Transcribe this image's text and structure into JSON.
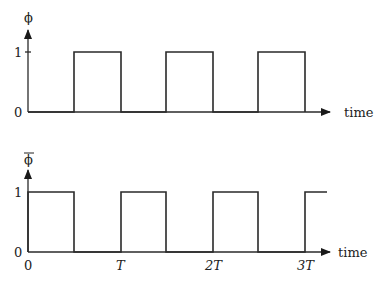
{
  "top_plot": {
    "y_label": "ϕ",
    "y_tick_high": "1",
    "y_tick_low": "0",
    "x_axis_label": "time",
    "levels": [
      0,
      1,
      0,
      1,
      0,
      1,
      0
    ]
  },
  "bottom_plot": {
    "y_label": "ϕ̄",
    "y_tick_high": "1",
    "y_tick_low": "0",
    "x_axis_label": "time",
    "x_ticks": [
      "0",
      "T",
      "2T",
      "3T"
    ],
    "levels": [
      1,
      0,
      1,
      0,
      1,
      0,
      1
    ]
  },
  "caption_fragment": ""
}
